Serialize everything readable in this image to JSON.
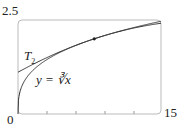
{
  "chart_data": {
    "type": "line",
    "title": "",
    "xlabel": "",
    "ylabel": "",
    "xlim": [
      0,
      15
    ],
    "ylim": [
      0,
      2.5
    ],
    "x_tick_labels": [
      "0",
      "15"
    ],
    "y_tick_labels": [
      "2.5"
    ],
    "x_minor_ticks": [
      3,
      6,
      9,
      12
    ],
    "series": [
      {
        "name": "y = ∛x",
        "function": "x^(1/3)"
      },
      {
        "name": "T2",
        "function": "2 + (x-8)/12 - (x-8)^2/288",
        "center": 8
      }
    ],
    "point": {
      "x": 8,
      "y": 2
    },
    "annotations": [
      {
        "text": "T",
        "sub": "2"
      },
      {
        "text": "y = ∛x"
      }
    ]
  },
  "labels": {
    "y_max": "2.5",
    "x_min": "0",
    "x_max": "15",
    "t2": "T",
    "t2_sub": "2",
    "curve": "y = ∛x"
  }
}
